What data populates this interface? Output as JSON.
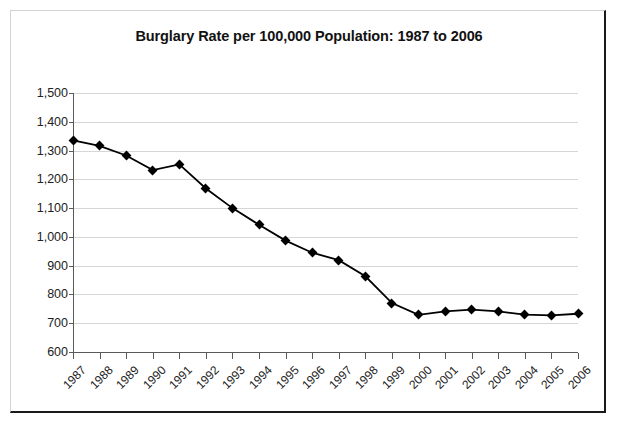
{
  "chart_data": {
    "type": "line",
    "title": "Burglary Rate per 100,000 Population: 1987 to 2006",
    "xlabel": "",
    "ylabel": "",
    "categories": [
      "1987",
      "1988",
      "1989",
      "1990",
      "1991",
      "1992",
      "1993",
      "1994",
      "1995",
      "1996",
      "1997",
      "1998",
      "1999",
      "2000",
      "2001",
      "2002",
      "2003",
      "2004",
      "2005",
      "2006"
    ],
    "values": [
      1335,
      1316,
      1283,
      1232,
      1252,
      1168,
      1100,
      1042,
      987,
      945,
      919,
      863,
      770,
      729,
      741,
      747,
      741,
      730,
      727,
      733
    ],
    "ylim": [
      600,
      1500
    ],
    "ytick_values": [
      600,
      700,
      800,
      900,
      1000,
      1100,
      1200,
      1300,
      1400,
      1500
    ],
    "ytick_labels": [
      "600",
      "700",
      "800",
      "900",
      "1,000",
      "1,100",
      "1,200",
      "1,300",
      "1,400",
      "1,500"
    ],
    "grid": true,
    "legend": "none",
    "series_color": "#000000",
    "marker": "diamond",
    "gridline_color": "#d6d6d6",
    "axis_color": "#5a5a5a"
  }
}
